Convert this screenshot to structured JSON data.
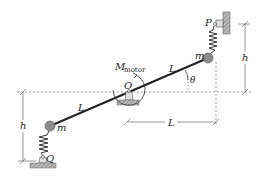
{
  "diagram": {
    "labels": {
      "motor_M": "M",
      "motor_sub": "motor",
      "pivot": "O",
      "top_pin": "P",
      "bottom_pin": "Q",
      "mass_top": "m",
      "mass_bottom": "m",
      "link_upper": "L",
      "link_lower": "L",
      "angle": "θ",
      "height_right": "h",
      "height_left": "h",
      "horizontal_dim": "L"
    },
    "colors": {
      "bar": "#222222",
      "mass": "#8a8a8a",
      "hatch": "#777777",
      "dashed": "#777777"
    }
  }
}
